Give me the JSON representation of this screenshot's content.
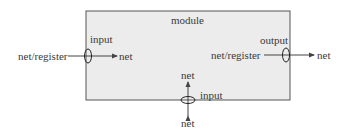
{
  "diagram": {
    "module": {
      "label": "module",
      "fill": "#ececec",
      "stroke": "#555555"
    },
    "left_port": {
      "outside_label": "net/register",
      "port_label": "input",
      "inside_label": "net"
    },
    "right_port": {
      "inside_label": "net/register",
      "port_label": "output",
      "outside_label": "net"
    },
    "bottom_port": {
      "inside_label": "net",
      "port_label": "input",
      "outside_label": "net"
    }
  }
}
